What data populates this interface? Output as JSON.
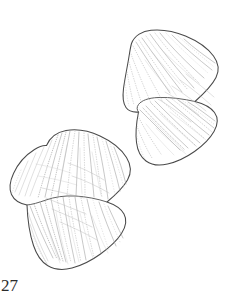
{
  "figure": {
    "number_label": "27",
    "caption": "",
    "background_color": "#ffffff",
    "outline_color": "#4a4a4a",
    "vein_color": "#a8a8a8",
    "label_color": "#2b2b2b",
    "specimen_count": 2,
    "specimens": [
      {
        "name": "upper-right-specimen",
        "position": "upper-right",
        "surface_texture": "stippled-striate-venation",
        "has_inner_lobe": true
      },
      {
        "name": "lower-left-specimen",
        "position": "lower-left",
        "surface_texture": "stippled-striate-venation",
        "has_inner_lobe": true
      }
    ]
  }
}
